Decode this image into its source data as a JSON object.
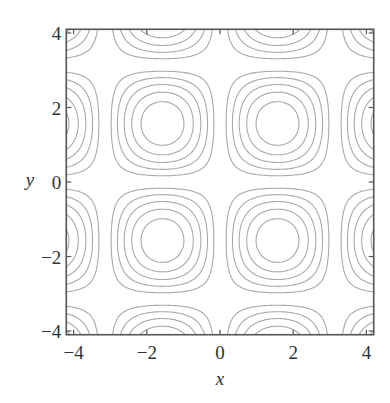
{
  "chart_data": {
    "type": "contour",
    "function": "sin(x) * sin(y)",
    "title": "",
    "xlabel": "x",
    "ylabel": "y",
    "xlim": [
      -4.2,
      4.2
    ],
    "ylim": [
      -4.1,
      4.1
    ],
    "xticks": [
      -4,
      -2,
      0,
      2,
      4
    ],
    "yticks": [
      -4,
      -2,
      0,
      2,
      4
    ],
    "xtick_labels": [
      "−4",
      "−2",
      "0",
      "2",
      "4"
    ],
    "ytick_labels": [
      "−4",
      "−2",
      "0",
      "2",
      "4"
    ],
    "levels": [
      -0.8333,
      -0.6667,
      -0.5,
      -0.3333,
      -0.1667,
      0.1667,
      0.3333,
      0.5,
      0.6667,
      0.8333
    ],
    "extrema_centers": [
      [
        -1.571,
        1.571
      ],
      [
        1.571,
        1.571
      ],
      [
        -1.571,
        -1.571
      ],
      [
        1.571,
        -1.571
      ]
    ],
    "grid": false,
    "legend": null,
    "colors": {
      "contour": "#a9a9a9",
      "frame": "#555555",
      "text": "#333333"
    }
  }
}
